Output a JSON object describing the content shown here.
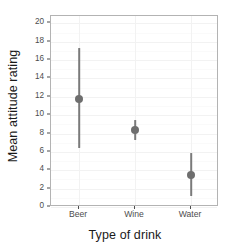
{
  "chart_data": {
    "type": "scatter",
    "title": "",
    "xlabel": "Type of drink",
    "ylabel": "Mean attitude rating",
    "categories": [
      "Beer",
      "Wine",
      "Water"
    ],
    "values": [
      11.8,
      8.35,
      3.5
    ],
    "error_low": [
      6.4,
      7.3,
      1.25
    ],
    "error_high": [
      17.3,
      9.5,
      5.85
    ],
    "ylim": [
      0,
      20.8
    ],
    "yticks": [
      0,
      2,
      4,
      6,
      8,
      10,
      12,
      14,
      16,
      18,
      20
    ],
    "ytick_labels": [
      "0",
      "2",
      "4",
      "6",
      "8",
      "10",
      "12",
      "14",
      "16",
      "18",
      "20"
    ],
    "grid": true,
    "legend": false,
    "point_color": "#6e6e6e",
    "errorbar_color": "#7a7a7a",
    "panel_border_color": "#b3b3b3",
    "panel_background": "#ffffff",
    "gridline_color": "#f2f2f2",
    "series": [
      {
        "name": "Mean attitude rating",
        "points": [
          {
            "category": "Beer",
            "mean": 11.8,
            "lower": 6.4,
            "upper": 17.3
          },
          {
            "category": "Wine",
            "mean": 8.35,
            "lower": 7.3,
            "upper": 9.5
          },
          {
            "category": "Water",
            "mean": 3.5,
            "lower": 1.25,
            "upper": 5.85
          }
        ]
      }
    ]
  },
  "axes": {
    "y_title": "Mean attitude rating",
    "x_title": "Type of drink"
  }
}
